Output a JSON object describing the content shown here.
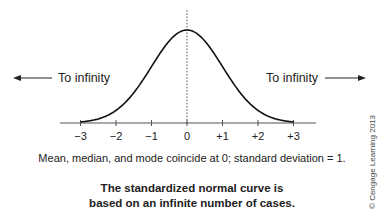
{
  "chart_data": {
    "type": "line",
    "title": "",
    "xlabel": "",
    "ylabel": "",
    "distribution": "standard normal",
    "mean": 0,
    "std_dev": 1,
    "xlim": [
      -3,
      3
    ],
    "x_ticks": [
      -3,
      -2,
      -1,
      0,
      1,
      2,
      3
    ],
    "x_tick_labels": [
      "−3",
      "−2",
      "−1",
      "0",
      "+1",
      "+2",
      "+3"
    ],
    "center_line_at": 0,
    "grid": false,
    "annotations": {
      "left": "To infinity",
      "right": "To infinity"
    }
  },
  "caption": "Mean, median, and mode coincide at 0; standard deviation = 1.",
  "note_lines": [
    "The standardized normal curve is",
    "based on an infinite number of cases."
  ],
  "copyright": "© Cengage Learning 2013",
  "colors": {
    "curve": "#111111",
    "axis": "#555555",
    "text": "#222222"
  }
}
